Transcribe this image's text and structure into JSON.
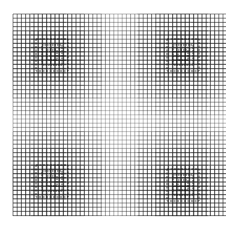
{
  "artwork": {
    "description": "Black and white line grid with four dense nested-square focal regions",
    "background": "#ffffff",
    "line_color": "#1a1a1a",
    "grid_bounds": {
      "x0": 13,
      "y0": 14,
      "x1": 226,
      "y1": 216
    },
    "pitch": 4.2,
    "focal_points": [
      {
        "cx": 52,
        "cy": 55
      },
      {
        "cx": 183,
        "cy": 55
      },
      {
        "cx": 52,
        "cy": 181
      },
      {
        "cx": 183,
        "cy": 185
      }
    ]
  }
}
